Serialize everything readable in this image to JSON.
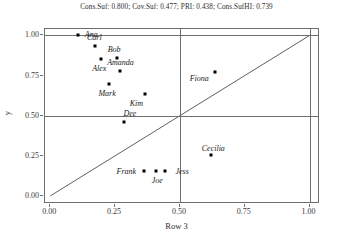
{
  "chart_data": {
    "type": "scatter",
    "title": "Cons.Suf: 0.800; Cov.Suf: 0.477; PRI: 0.438; Cons.SufHI: 0.739",
    "xlabel": "Row 3",
    "ylabel": "y",
    "xlim": [
      -0.02,
      1.04
    ],
    "ylim": [
      -0.05,
      1.04
    ],
    "xticks": [
      "0.00",
      "0.25",
      "0.50",
      "0.75",
      "1.00"
    ],
    "xtick_values": [
      0.0,
      0.25,
      0.5,
      0.75,
      1.0
    ],
    "yticks": [
      "0.00",
      "0.25",
      "0.50",
      "0.75",
      "1.00"
    ],
    "ytick_values": [
      0.0,
      0.25,
      0.5,
      0.75,
      1.0
    ],
    "grid": true,
    "gridlines_x": [
      0.5,
      1.0
    ],
    "gridlines_y": [
      0.5,
      1.0
    ],
    "reference_line": {
      "type": "diagonal",
      "from": [
        0.0,
        0.0
      ],
      "to": [
        1.0,
        1.0
      ],
      "color": "#4d4d4d"
    },
    "legend": "none",
    "marker_color": "#000000",
    "points": [
      {
        "label": "Ana",
        "x": 0.108,
        "y": 1.0,
        "label_dx": 13,
        "label_dy": -1
      },
      {
        "label": "Carl",
        "x": 0.174,
        "y": 0.932,
        "label_dx": -1,
        "label_dy": -9
      },
      {
        "label": "Bob",
        "x": 0.258,
        "y": 0.858,
        "label_dx": -3,
        "label_dy": -9
      },
      {
        "label": "Alex",
        "x": 0.197,
        "y": 0.852,
        "label_dx": -2,
        "label_dy": 9
      },
      {
        "label": "Amanda",
        "x": 0.271,
        "y": 0.776,
        "label_dx": 0,
        "label_dy": -9
      },
      {
        "label": "Mark",
        "x": 0.227,
        "y": 0.697,
        "label_dx": -2,
        "label_dy": 9
      },
      {
        "label": "Fiona",
        "x": 0.636,
        "y": 0.773,
        "label_dx": -16,
        "label_dy": 6
      },
      {
        "label": "Kim",
        "x": 0.367,
        "y": 0.638,
        "label_dx": -9,
        "label_dy": 9
      },
      {
        "label": "Dee",
        "x": 0.284,
        "y": 0.462,
        "label_dx": 6,
        "label_dy": -9
      },
      {
        "label": "Cecilia",
        "x": 0.621,
        "y": 0.258,
        "label_dx": 2,
        "label_dy": -7
      },
      {
        "label": "Frank",
        "x": 0.363,
        "y": 0.155,
        "label_dx": -18,
        "label_dy": 0
      },
      {
        "label": "Joe",
        "x": 0.409,
        "y": 0.155,
        "label_dx": 1,
        "label_dy": 9
      },
      {
        "label": "Jess",
        "x": 0.443,
        "y": 0.155,
        "label_dx": 17,
        "label_dy": 0
      }
    ]
  }
}
